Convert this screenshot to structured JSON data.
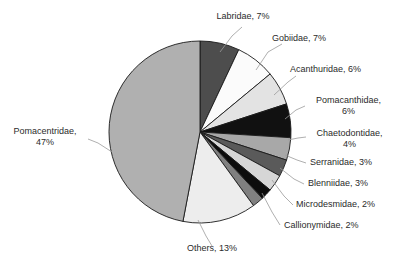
{
  "chart_data": {
    "type": "pie",
    "title": "",
    "subtitle": "",
    "xlabel": "",
    "ylabel": "",
    "legend": "none",
    "grid": false,
    "label_format": "{name}, {value}%",
    "start_angle_deg": 0,
    "direction": "clockwise",
    "categories": [
      "Labridae",
      "Gobiidae",
      "Acanthuridae",
      "Pomacanthidae",
      "Chaetodontidae",
      "Serranidae",
      "Blenniidae",
      "Microdesmidae",
      "Callionymidae",
      "Others",
      "Pomacentridae"
    ],
    "values": [
      7,
      7,
      6,
      6,
      4,
      3,
      3,
      2,
      2,
      13,
      47
    ],
    "unit": "%",
    "colors": [
      "#4d4d4d",
      "#fbfbfb",
      "#e3e3e3",
      "#111111",
      "#a8a8a8",
      "#5a5a5a",
      "#d6d6d6",
      "#0d0d0d",
      "#808080",
      "#ededed",
      "#b0b0b0"
    ],
    "slices": [
      {
        "name": "Labridae",
        "value": 7,
        "label": "Labridae, 7%",
        "color": "#4d4d4d"
      },
      {
        "name": "Gobiidae",
        "value": 7,
        "label": "Gobiidae, 7%",
        "color": "#fbfbfb"
      },
      {
        "name": "Acanthuridae",
        "value": 6,
        "label": "Acanthuridae, 6%",
        "color": "#e3e3e3"
      },
      {
        "name": "Pomacanthidae",
        "value": 6,
        "label": "Pomacanthidae, 6%",
        "color": "#111111"
      },
      {
        "name": "Chaetodontidae",
        "value": 4,
        "label": "Chaetodontidae, 4%",
        "color": "#a8a8a8"
      },
      {
        "name": "Serranidae",
        "value": 3,
        "label": "Serranidae, 3%",
        "color": "#5a5a5a"
      },
      {
        "name": "Blenniidae",
        "value": 3,
        "label": "Blenniidae, 3%",
        "color": "#d6d6d6"
      },
      {
        "name": "Microdesmidae",
        "value": 2,
        "label": "Microdesmidae, 2%",
        "color": "#0d0d0d"
      },
      {
        "name": "Callionymidae",
        "value": 2,
        "label": "Callionymidae, 2%",
        "color": "#808080"
      },
      {
        "name": "Others",
        "value": 13,
        "label": "Others, 13%",
        "color": "#ededed"
      },
      {
        "name": "Pomacentridae",
        "value": 47,
        "label": "Pomacentridae, 47%",
        "color": "#b0b0b0"
      }
    ]
  },
  "labels": {
    "labridae_name": "Labridae, 7%",
    "gobiidae_name": "Gobiidae, 7%",
    "acanthuridae_name": "Acanthuridae, 6%",
    "pomacanthidae_name": "Pomacanthidae,",
    "pomacanthidae_value": "6%",
    "chaetodontidae_name": "Chaetodontidae,",
    "chaetodontidae_value": "4%",
    "serranidae_name": "Serranidae, 3%",
    "blenniidae_name": "Blenniidae, 3%",
    "microdesmidae_name": "Microdesmidae, 2%",
    "callionymidae_name": "Callionymidae, 2%",
    "others_name": "Others, 13%",
    "pomacentridae_name": "Pomacentridae,",
    "pomacentridae_value": "47%"
  }
}
